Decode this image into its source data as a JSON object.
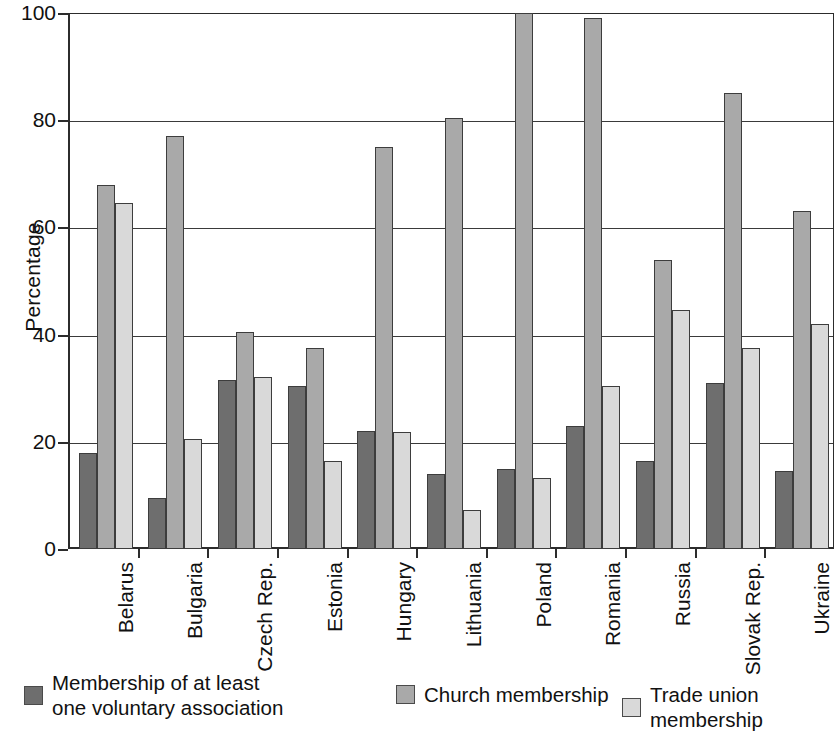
{
  "chart_data": {
    "type": "bar",
    "title": "",
    "subtitle": "",
    "xlabel": "",
    "ylabel": "Percentage",
    "ylim": [
      0,
      100
    ],
    "yticks": [
      0,
      20,
      40,
      60,
      80,
      100
    ],
    "ytick_labels": [
      "0",
      "20",
      "40",
      "60",
      "80",
      "100"
    ],
    "grid": "horizontal",
    "legend_position": "bottom",
    "categories": [
      "Belarus",
      "Bulgaria",
      "Czech Rep.",
      "Estonia",
      "Hungary",
      "Lithuania",
      "Poland",
      "Romania",
      "Russia",
      "Slovak Rep.",
      "Ukraine"
    ],
    "series": [
      {
        "name": "Membership of at least\none voluntary association",
        "color": "#6e6e6e",
        "values": [
          18.0,
          9.5,
          31.5,
          30.5,
          22.0,
          14.0,
          15.0,
          23.0,
          16.5,
          31.0,
          14.5
        ]
      },
      {
        "name": "Church membership",
        "color": "#a9a9a9",
        "values": [
          68.0,
          77.0,
          40.5,
          37.5,
          75.0,
          80.5,
          100.0,
          99.0,
          54.0,
          85.0,
          63.0
        ]
      },
      {
        "name": "Trade union membership",
        "color": "#d9d9d9",
        "values": [
          64.5,
          20.5,
          32.0,
          16.5,
          21.8,
          7.3,
          13.3,
          30.5,
          44.5,
          37.5,
          42.0
        ]
      }
    ]
  },
  "legend": {
    "items": [
      {
        "label": "Membership of at least\none voluntary association",
        "swatch": "s0"
      },
      {
        "label": "Church membership",
        "swatch": "s1"
      },
      {
        "label": "Trade union membership",
        "swatch": "s2"
      }
    ]
  },
  "axes": {
    "y_title": "Percentage"
  }
}
